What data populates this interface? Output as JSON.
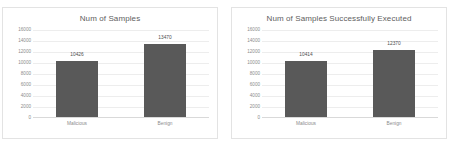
{
  "chart_data": [
    {
      "type": "bar",
      "title": "Num of Samples",
      "categories": [
        "Malicious",
        "Benign"
      ],
      "values": [
        10426,
        13470
      ],
      "labels": [
        "10426",
        "13470"
      ],
      "xlabel": "",
      "ylabel": "",
      "ylim": [
        0,
        16000
      ],
      "yticks": [
        16000,
        14000,
        12000,
        10000,
        8000,
        6000,
        4000,
        2000,
        0
      ],
      "ytick_labels": [
        "16000",
        "14000",
        "12000",
        "10000",
        "8000",
        "6000",
        "4000",
        "2000",
        "0"
      ],
      "grid": true,
      "legend": false,
      "bar_color": "#595959"
    },
    {
      "type": "bar",
      "title": "Num of Samples Successfully Executed",
      "categories": [
        "Malicious",
        "Benign"
      ],
      "values": [
        10414,
        12370
      ],
      "labels": [
        "10414",
        "12370"
      ],
      "xlabel": "",
      "ylabel": "",
      "ylim": [
        0,
        16000
      ],
      "yticks": [
        16000,
        14000,
        12000,
        10000,
        8000,
        6000,
        4000,
        2000,
        0
      ],
      "ytick_labels": [
        "16000",
        "14000",
        "12000",
        "10000",
        "8000",
        "6000",
        "4000",
        "2000",
        "0"
      ],
      "grid": true,
      "legend": false,
      "bar_color": "#595959"
    }
  ]
}
